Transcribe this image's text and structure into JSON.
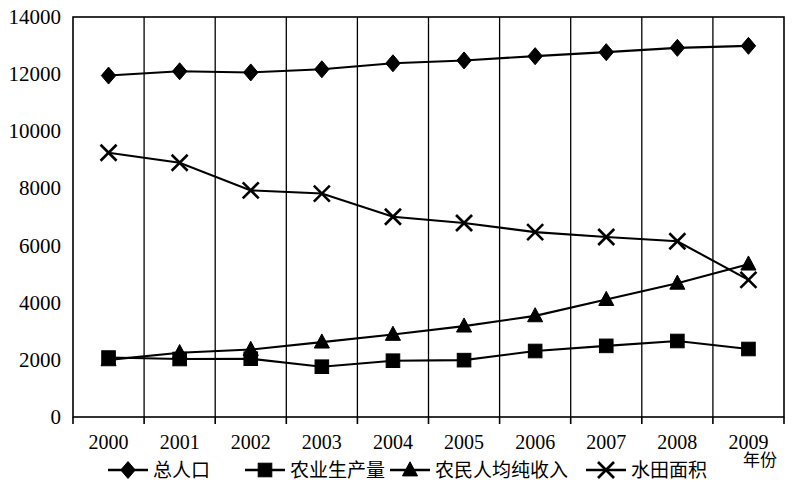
{
  "chart_data": {
    "type": "line",
    "title": "",
    "subtitle": "",
    "xlabel": "年份",
    "ylabel": "",
    "categories": [
      "2000",
      "2001",
      "2002",
      "2003",
      "2004",
      "2005",
      "2006",
      "2007",
      "2008",
      "2009"
    ],
    "x": [
      2000,
      2001,
      2002,
      2003,
      2004,
      2005,
      2006,
      2007,
      2008,
      2009
    ],
    "ylim": [
      0,
      14000
    ],
    "yticks": [
      0,
      2000,
      4000,
      6000,
      8000,
      10000,
      12000,
      14000
    ],
    "ytick_labels": [
      "0",
      "2000",
      "4000",
      "6000",
      "8000",
      "10000",
      "12000",
      "14000"
    ],
    "grid": "vertical",
    "legend_position": "bottom",
    "series": [
      {
        "name": "总人口",
        "marker": "diamond",
        "values": [
          11950,
          12100,
          12060,
          12170,
          12380,
          12480,
          12630,
          12770,
          12920,
          12990
        ]
      },
      {
        "name": "农业生产量",
        "marker": "square",
        "values": [
          2080,
          2030,
          2040,
          1760,
          1970,
          1990,
          2310,
          2490,
          2660,
          2380
        ]
      },
      {
        "name": "农民人均纯收入",
        "marker": "triangle",
        "values": [
          2000,
          2250,
          2360,
          2620,
          2890,
          3180,
          3540,
          4110,
          4680,
          5350
        ]
      },
      {
        "name": "水田面积",
        "marker": "x",
        "values": [
          9250,
          8900,
          7930,
          7820,
          7010,
          6790,
          6470,
          6300,
          6150,
          4800
        ]
      }
    ]
  },
  "legend": {
    "items": [
      {
        "label": "总人口",
        "marker": "diamond"
      },
      {
        "label": "农业生产量",
        "marker": "square"
      },
      {
        "label": "农民人均纯收入",
        "marker": "triangle"
      },
      {
        "label": "水田面积",
        "marker": "x"
      }
    ]
  },
  "axis": {
    "x_axis_title": "年份"
  }
}
